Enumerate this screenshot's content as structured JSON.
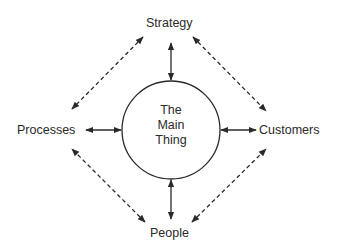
{
  "diagram": {
    "center": {
      "lines": [
        "The",
        "Main",
        "Thing"
      ]
    },
    "nodes": {
      "top": "Strategy",
      "left": "Processes",
      "right": "Customers",
      "bottom": "People"
    },
    "connections": [
      {
        "from": "The Main Thing",
        "to": "Strategy",
        "style": "solid",
        "direction": "bidirectional"
      },
      {
        "from": "The Main Thing",
        "to": "Processes",
        "style": "solid",
        "direction": "bidirectional"
      },
      {
        "from": "The Main Thing",
        "to": "Customers",
        "style": "solid",
        "direction": "bidirectional"
      },
      {
        "from": "The Main Thing",
        "to": "People",
        "style": "solid",
        "direction": "bidirectional"
      },
      {
        "from": "Strategy",
        "to": "Processes",
        "style": "dashed",
        "direction": "bidirectional"
      },
      {
        "from": "Strategy",
        "to": "Customers",
        "style": "dashed",
        "direction": "bidirectional"
      },
      {
        "from": "People",
        "to": "Processes",
        "style": "dashed",
        "direction": "bidirectional"
      },
      {
        "from": "People",
        "to": "Customers",
        "style": "dashed",
        "direction": "bidirectional"
      }
    ],
    "colors": {
      "stroke": "#2a2a2a",
      "background": "#ffffff"
    }
  }
}
